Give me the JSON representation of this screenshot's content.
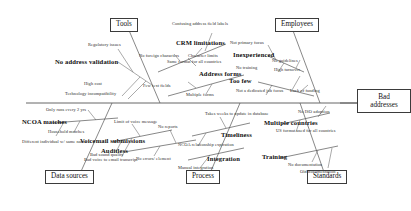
{
  "diagram": {
    "type": "fishbone-ishikawa",
    "effect": {
      "label": "Bad\naddresses",
      "label_text": "Bad addresses"
    },
    "categories": [
      {
        "id": "tools",
        "label": "Tools",
        "side": "top"
      },
      {
        "id": "employees",
        "label": "Employees",
        "side": "top"
      },
      {
        "id": "data-sources",
        "label": "Data sources",
        "side": "bottom"
      },
      {
        "id": "process",
        "label": "Process",
        "side": "bottom"
      },
      {
        "id": "standards",
        "label": "Standards",
        "side": "bottom"
      }
    ],
    "bones": [
      {
        "id": "no-address-validation",
        "label": "No address validation",
        "category": "tools",
        "causes": [
          "Regulatory issues",
          "High cost",
          "Technology incompatibility"
        ]
      },
      {
        "id": "crm-limitations",
        "label": "CRM limitations",
        "category": "tools",
        "causes": [
          "Confusing address field labels",
          "No foreign characters",
          "Character limits",
          "Same format for all countries"
        ]
      },
      {
        "id": "address-forms",
        "label": "Address forms",
        "category": "tools",
        "causes": [
          "Few text fields",
          "Multiple forms"
        ]
      },
      {
        "id": "inexperienced",
        "label": "Inexperienced",
        "category": "employees",
        "causes": [
          "Not primary focus",
          "No training",
          "No guidelines"
        ]
      },
      {
        "id": "too-few",
        "label": "Too few",
        "category": "employees",
        "causes": [
          "High turnover",
          "Not a dedicated job focus",
          "Lack of funding"
        ]
      },
      {
        "id": "ncoa-matches",
        "label": "NCOA matches",
        "category": "data-sources",
        "causes": [
          "Only runs every 2 yrs",
          "Household matches",
          "Different individual w/ same name"
        ]
      },
      {
        "id": "voicemail-submissions",
        "label": "Voicemail submissions",
        "category": "data-sources",
        "causes": [
          "Limit of voice message",
          "Bad sound quality",
          "Bad voice to email transcript"
        ]
      },
      {
        "id": "auditless",
        "label": "Auditless",
        "category": "data-sources",
        "causes": [
          "No reports",
          "No errors/ element"
        ]
      },
      {
        "id": "timeliness",
        "label": "Timeliness",
        "category": "process",
        "causes": [
          "Takes weeks to update in database",
          "NCOA relationship expiration"
        ]
      },
      {
        "id": "integration",
        "label": "Integration",
        "category": "process",
        "causes": [
          "Manual integration"
        ]
      },
      {
        "id": "multiple-countries",
        "label": "Multiple countries",
        "category": "standards",
        "causes": [
          "No ISO adoption",
          "US format used for all countries"
        ]
      },
      {
        "id": "training",
        "label": "Training",
        "category": "standards",
        "causes": [
          "No documentation",
          "Old documentation"
        ]
      }
    ]
  },
  "colors": {
    "line": "#555555",
    "text": "#111111",
    "box_border": "#3b3b3b",
    "background": "#ffffff"
  }
}
